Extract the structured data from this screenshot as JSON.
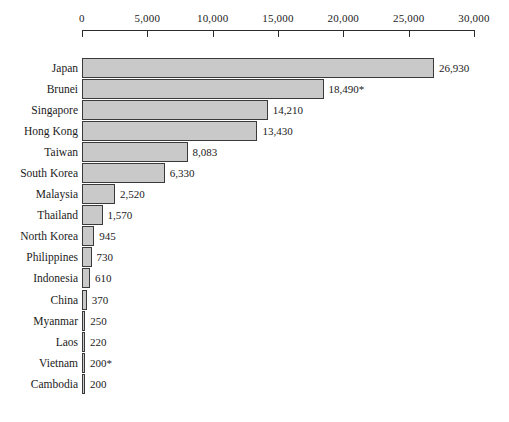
{
  "chart_data": {
    "type": "bar",
    "orientation": "horizontal",
    "title": "",
    "subtitle": "",
    "xlabel": "",
    "ylabel": "",
    "xlim": [
      0,
      30000
    ],
    "grid": false,
    "legend": null,
    "axis": {
      "ticks": [
        0,
        5000,
        10000,
        15000,
        20000,
        25000,
        30000
      ],
      "tick_labels": [
        "0",
        "5,000",
        "10,000",
        "15,000",
        "20,000",
        "25,000",
        "30,000"
      ],
      "position": "top"
    },
    "categories": [
      "Japan",
      "Brunei",
      "Singapore",
      "Hong Kong",
      "Taiwan",
      "South Korea",
      "Malaysia",
      "Thailand",
      "North Korea",
      "Philippines",
      "Indonesia",
      "China",
      "Myanmar",
      "Laos",
      "Vietnam",
      "Cambodia"
    ],
    "values": [
      26930,
      18490,
      14210,
      13430,
      8083,
      6330,
      2520,
      1570,
      945,
      730,
      610,
      370,
      250,
      220,
      200,
      200
    ],
    "value_labels": [
      "26,930",
      "18,490*",
      "14,210",
      "13,430",
      "8,083",
      "6,330",
      "2,520",
      "1,570",
      "945",
      "730",
      "610",
      "370",
      "250",
      "220",
      "200*",
      "200"
    ],
    "colors": {
      "bar_fill": "#c9c9c9",
      "bar_stroke": "#3a3a3a",
      "axis": "#2b2b2b",
      "text": "#1a1a1a",
      "background": "#ffffff"
    }
  }
}
